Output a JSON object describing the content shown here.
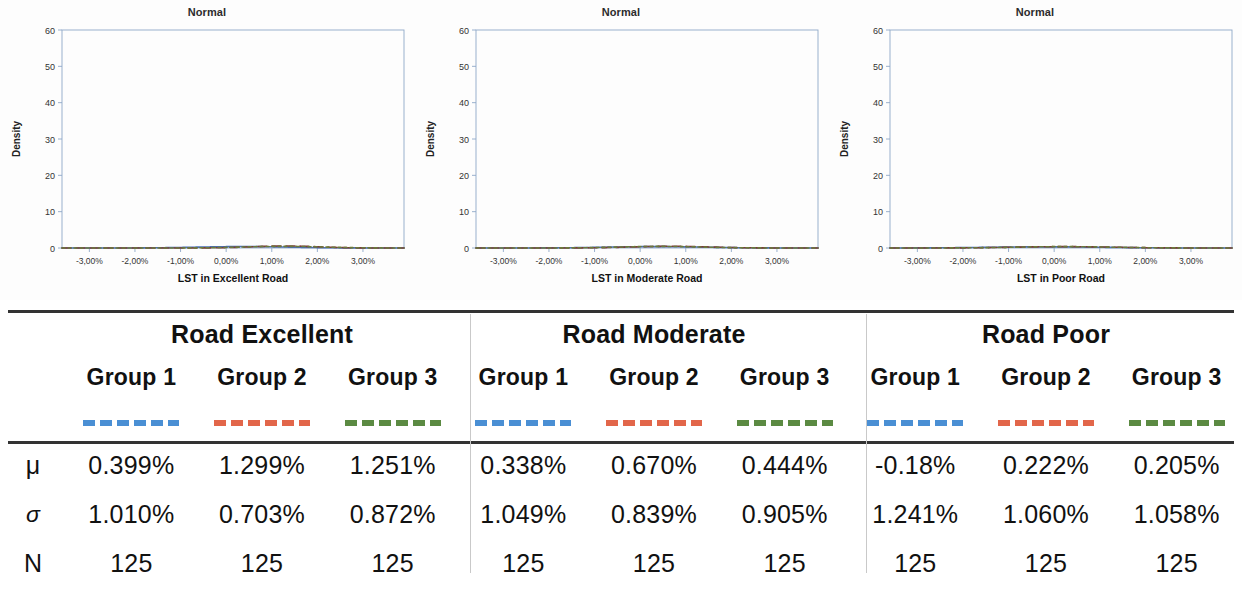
{
  "charts": {
    "title": "Normal",
    "ylabel": "Density",
    "yticks": [
      "0",
      "10",
      "20",
      "30",
      "40",
      "50",
      "60"
    ],
    "xticks": [
      "-3,00%",
      "-2,00%",
      "-1,00%",
      "0,00%",
      "1,00%",
      "2,00%",
      "3,00%"
    ],
    "panels": [
      {
        "name": "chart-excellent",
        "xlabel": "LST in Excellent Road"
      },
      {
        "name": "chart-moderate",
        "xlabel": "LST in Moderate Road"
      },
      {
        "name": "chart-poor",
        "xlabel": "LST in Poor Road"
      }
    ]
  },
  "colors": {
    "group1": "#4a8fd4",
    "group2": "#e2664a",
    "group3": "#5b8a42",
    "curve1": "#4a6fb5",
    "curve2": "#7e3a3a",
    "curve3": "#6b7a3a",
    "axis": "#8fa8c8",
    "rule": "#333333"
  },
  "table": {
    "row_labels": {
      "mu": "μ",
      "sigma": "σ",
      "n": "N"
    },
    "sections": [
      {
        "name": "road-excellent",
        "title": "Road Excellent",
        "groups": [
          {
            "label": "Group 1",
            "color_key": "group1",
            "mu": "0.399%",
            "sigma": "1.010%",
            "n": "125",
            "mu_val": 0.399,
            "sigma_val": 1.01
          },
          {
            "label": "Group 2",
            "color_key": "group2",
            "mu": "1.299%",
            "sigma": "0.703%",
            "n": "125",
            "mu_val": 1.299,
            "sigma_val": 0.703
          },
          {
            "label": "Group 3",
            "color_key": "group3",
            "mu": "1.251%",
            "sigma": "0.872%",
            "n": "125",
            "mu_val": 1.251,
            "sigma_val": 0.872
          }
        ]
      },
      {
        "name": "road-moderate",
        "title": "Road Moderate",
        "groups": [
          {
            "label": "Group 1",
            "color_key": "group1",
            "mu": "0.338%",
            "sigma": "1.049%",
            "n": "125",
            "mu_val": 0.338,
            "sigma_val": 1.049
          },
          {
            "label": "Group 2",
            "color_key": "group2",
            "mu": "0.670%",
            "sigma": "0.839%",
            "n": "125",
            "mu_val": 0.67,
            "sigma_val": 0.839
          },
          {
            "label": "Group 3",
            "color_key": "group3",
            "mu": "0.444%",
            "sigma": "0.905%",
            "n": "125",
            "mu_val": 0.444,
            "sigma_val": 0.905
          }
        ]
      },
      {
        "name": "road-poor",
        "title": "Road Poor",
        "groups": [
          {
            "label": "Group 1",
            "color_key": "group1",
            "mu": "-0.18%",
            "sigma": "1.241%",
            "n": "125",
            "mu_val": -0.18,
            "sigma_val": 1.241
          },
          {
            "label": "Group 2",
            "color_key": "group2",
            "mu": "0.222%",
            "sigma": "1.060%",
            "n": "125",
            "mu_val": 0.222,
            "sigma_val": 1.06
          },
          {
            "label": "Group 3",
            "color_key": "group3",
            "mu": "0.205%",
            "sigma": "1.058%",
            "n": "125",
            "mu_val": 0.205,
            "sigma_val": 1.058
          }
        ]
      }
    ]
  },
  "chart_data": [
    {
      "type": "line",
      "name": "chart-excellent",
      "title": "Normal",
      "xlabel": "LST in Excellent Road",
      "ylabel": "Density",
      "xlim": [
        -3.6,
        3.9
      ],
      "ylim": [
        0,
        60
      ],
      "xticks": [
        -3,
        -2,
        -1,
        0,
        1,
        2,
        3
      ],
      "xticklabels": [
        "-3,00%",
        "-2,00%",
        "-1,00%",
        "0,00%",
        "1,00%",
        "2,00%",
        "3,00%"
      ],
      "yticks": [
        0,
        10,
        20,
        30,
        40,
        50,
        60
      ],
      "grid": false,
      "legend": "none",
      "series": [
        {
          "name": "Group 1",
          "distribution": "normal",
          "mu": 0.399,
          "sigma": 1.01,
          "n": 125,
          "peak_density": 39.5,
          "style": "solid",
          "color": "#4a6fb5"
        },
        {
          "name": "Group 2",
          "distribution": "normal",
          "mu": 1.299,
          "sigma": 0.703,
          "n": 125,
          "peak_density": 56.7,
          "style": "dashed",
          "color": "#7e3a3a"
        },
        {
          "name": "Group 3",
          "distribution": "normal",
          "mu": 1.251,
          "sigma": 0.872,
          "n": 125,
          "peak_density": 45.7,
          "style": "dotted",
          "color": "#6b7a3a"
        }
      ]
    },
    {
      "type": "line",
      "name": "chart-moderate",
      "title": "Normal",
      "xlabel": "LST in Moderate Road",
      "ylabel": "Density",
      "xlim": [
        -3.6,
        3.9
      ],
      "ylim": [
        0,
        60
      ],
      "xticks": [
        -3,
        -2,
        -1,
        0,
        1,
        2,
        3
      ],
      "xticklabels": [
        "-3,00%",
        "-2,00%",
        "-1,00%",
        "0,00%",
        "1,00%",
        "2,00%",
        "3,00%"
      ],
      "yticks": [
        0,
        10,
        20,
        30,
        40,
        50,
        60
      ],
      "grid": false,
      "legend": "none",
      "series": [
        {
          "name": "Group 1",
          "distribution": "normal",
          "mu": 0.338,
          "sigma": 1.049,
          "n": 125,
          "peak_density": 38.0,
          "style": "solid",
          "color": "#4a6fb5"
        },
        {
          "name": "Group 2",
          "distribution": "normal",
          "mu": 0.67,
          "sigma": 0.839,
          "n": 125,
          "peak_density": 47.5,
          "style": "dashed",
          "color": "#7e3a3a"
        },
        {
          "name": "Group 3",
          "distribution": "normal",
          "mu": 0.444,
          "sigma": 0.905,
          "n": 125,
          "peak_density": 44.1,
          "style": "dotted",
          "color": "#6b7a3a"
        }
      ]
    },
    {
      "type": "line",
      "name": "chart-poor",
      "title": "Normal",
      "xlabel": "LST in Poor Road",
      "ylabel": "Density",
      "xlim": [
        -3.6,
        3.9
      ],
      "ylim": [
        0,
        60
      ],
      "xticks": [
        -3,
        -2,
        -1,
        0,
        1,
        2,
        3
      ],
      "xticklabels": [
        "-3,00%",
        "-2,00%",
        "-1,00%",
        "0,00%",
        "1,00%",
        "2,00%",
        "3,00%"
      ],
      "yticks": [
        0,
        10,
        20,
        30,
        40,
        50,
        60
      ],
      "grid": false,
      "legend": "none",
      "series": [
        {
          "name": "Group 1",
          "distribution": "normal",
          "mu": -0.18,
          "sigma": 1.241,
          "n": 125,
          "peak_density": 32.1,
          "style": "solid",
          "color": "#4a6fb5"
        },
        {
          "name": "Group 2",
          "distribution": "normal",
          "mu": 0.222,
          "sigma": 1.06,
          "n": 125,
          "peak_density": 37.6,
          "style": "dashed",
          "color": "#7e3a3a"
        },
        {
          "name": "Group 3",
          "distribution": "normal",
          "mu": 0.205,
          "sigma": 1.058,
          "n": 125,
          "peak_density": 37.7,
          "style": "dotted",
          "color": "#6b7a3a"
        }
      ]
    }
  ]
}
